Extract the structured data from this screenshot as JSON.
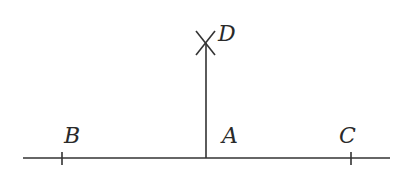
{
  "diagram": {
    "type": "geometric-construction",
    "stroke_color": "#333333",
    "label_color": "#2a2a2a",
    "points": {
      "A": {
        "label": "A",
        "x": 206,
        "y": 158
      },
      "B": {
        "label": "B",
        "x": 62,
        "y": 158
      },
      "C": {
        "label": "C",
        "x": 351,
        "y": 158
      },
      "D": {
        "label": "D",
        "x": 205,
        "y": 43
      }
    },
    "segments": [
      {
        "name": "base-line",
        "from": [
          23,
          158
        ],
        "to": [
          390,
          158
        ]
      },
      {
        "name": "perpendicular-AD",
        "from": [
          206,
          158
        ],
        "to": [
          206,
          43
        ]
      }
    ],
    "ticks": [
      {
        "point": "B",
        "x": 62,
        "y": 158
      },
      {
        "point": "C",
        "x": 351,
        "y": 158
      }
    ],
    "cross_mark": {
      "point": "D",
      "center": [
        205,
        43
      ],
      "half_size": 10
    }
  },
  "labels": {
    "A": "A",
    "B": "B",
    "C": "C",
    "D": "D"
  }
}
